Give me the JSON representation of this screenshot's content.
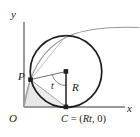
{
  "figure": {
    "kind": "cycloid-generating-circle-diagram",
    "background_color": "#ffffff",
    "axes": {
      "color": "#8f8f8f",
      "y_label": "y",
      "x_label": "x",
      "origin_label": "O",
      "origin_px": {
        "x": 24,
        "y": 107
      },
      "x_axis_end_px": {
        "x": 125,
        "y": 107
      },
      "y_axis_top_px": {
        "x": 24,
        "y": 22
      }
    },
    "circle": {
      "label": "rolling-circle",
      "stroke_color": "#1a1a1a",
      "center_px": {
        "x": 66,
        "y": 71.5
      },
      "radius_px": 36,
      "stroke_width": 1.6
    },
    "points": {
      "P": {
        "label": "P",
        "px": {
          "x": 30.4,
          "y": 79.6
        },
        "marker": "filled-square",
        "color": "#1a1a1a"
      },
      "C": {
        "label": "C = (Rt, 0)",
        "label_parts": {
          "name": "C",
          "equals": " = (",
          "coord_x": "Rt",
          "coord_y": ", 0)"
        },
        "px": {
          "x": 66,
          "y": 107
        },
        "marker": "filled-square",
        "color": "#1a1a1a"
      },
      "center": {
        "label": "circle-center",
        "px": {
          "x": 66,
          "y": 71.5
        },
        "marker": "filled-square",
        "color": "#1a1a1a"
      }
    },
    "segments": {
      "radius_vertical": {
        "label": "R",
        "from_px": {
          "x": 66,
          "y": 71.5
        },
        "to_px": {
          "x": 66,
          "y": 107
        },
        "color": "#1a1a1a",
        "stroke_width": 1.4
      },
      "radius_to_P": {
        "label": "radius-to-P",
        "from_px": {
          "x": 66,
          "y": 71.5
        },
        "to_px": {
          "x": 30.4,
          "y": 79.6
        },
        "color": "#6e6e6e",
        "stroke_width": 0.9
      },
      "chord_P_to_C": {
        "label": "chord-P-to-contact",
        "from_px": {
          "x": 30.4,
          "y": 79.6
        },
        "to_px": {
          "x": 66,
          "y": 107
        },
        "color": "#8a8a8a",
        "stroke_width": 0.9
      },
      "P_to_origin": {
        "label": "segment-P-to-origin",
        "from_px": {
          "x": 30.4,
          "y": 79.6
        },
        "to_px": {
          "x": 24,
          "y": 107
        },
        "color": "#9a9a9a",
        "stroke_width": 0.8
      },
      "top_chord": {
        "label": "chord-P-to-top",
        "from_px": {
          "x": 30.4,
          "y": 79.6
        },
        "to_px": {
          "x": 66,
          "y": 35.5
        },
        "color": "#a8a8a8",
        "stroke_width": 0.8
      }
    },
    "angle_arc": {
      "label": "t",
      "vertex_px": {
        "x": 66,
        "y": 71.5
      },
      "radius_px": 14,
      "color": "#6e6e6e"
    },
    "curve": {
      "label": "cycloid-curve",
      "color": "#8a8a8a",
      "stroke_width": 1.1,
      "path": "M24,107 C26,96 27,89 30.4,79.6 C38,58 52,42 70,35 C90,28 112,27 138,28"
    },
    "shaded_region": {
      "label": "shaded-area-under-curve",
      "fill_color": "#e3e3e3",
      "opacity": 0.85
    }
  }
}
